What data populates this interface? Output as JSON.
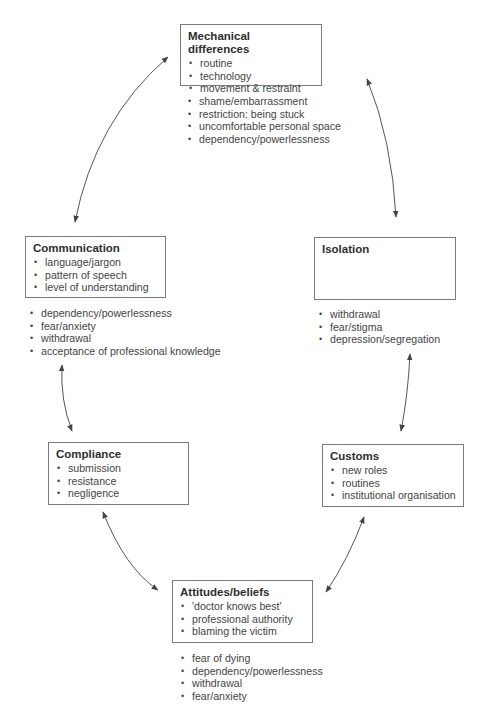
{
  "diagram": {
    "type": "cycle",
    "nodes": [
      {
        "id": "mechanical",
        "title": "Mechanical differences",
        "items": [
          "routine",
          "technology",
          "movement & restraint"
        ],
        "effects": [
          "shame/embarrassment",
          "restriction: being stuck",
          "uncomfortable personal space",
          "dependency/powerlessness"
        ]
      },
      {
        "id": "isolation",
        "title": "Isolation",
        "items": [],
        "effects": [
          "withdrawal",
          "fear/stigma",
          "depression/segregation"
        ]
      },
      {
        "id": "customs",
        "title": "Customs",
        "items": [
          "new roles",
          "routines",
          "institutional organisation"
        ],
        "effects": []
      },
      {
        "id": "attitudes",
        "title": "Attitudes/beliefs",
        "items": [
          "'doctor knows best'",
          "professional authority",
          "blaming the victim"
        ],
        "effects": [
          "fear of dying",
          "dependency/powerlessness",
          "withdrawal",
          "fear/anxiety"
        ]
      },
      {
        "id": "compliance",
        "title": "Compliance",
        "items": [
          "submission",
          "resistance",
          "negligence"
        ],
        "effects": []
      },
      {
        "id": "communication",
        "title": "Communication",
        "items": [
          "language/jargon",
          "pattern of speech",
          "level of understanding"
        ],
        "effects": [
          "dependency/powerlessness",
          "fear/anxiety",
          "withdrawal",
          "acceptance of professional knowledge"
        ]
      }
    ],
    "connections": [
      {
        "from": "mechanical",
        "to": "isolation",
        "bidirectional": true
      },
      {
        "from": "isolation",
        "to": "customs",
        "bidirectional": true
      },
      {
        "from": "customs",
        "to": "attitudes",
        "bidirectional": true
      },
      {
        "from": "attitudes",
        "to": "compliance",
        "bidirectional": true
      },
      {
        "from": "compliance",
        "to": "communication",
        "bidirectional": true
      },
      {
        "from": "communication",
        "to": "mechanical",
        "bidirectional": true
      }
    ],
    "colors": {
      "line": "#555555",
      "box_border": "#7a7a7a",
      "text": "#3a3a3a"
    }
  }
}
